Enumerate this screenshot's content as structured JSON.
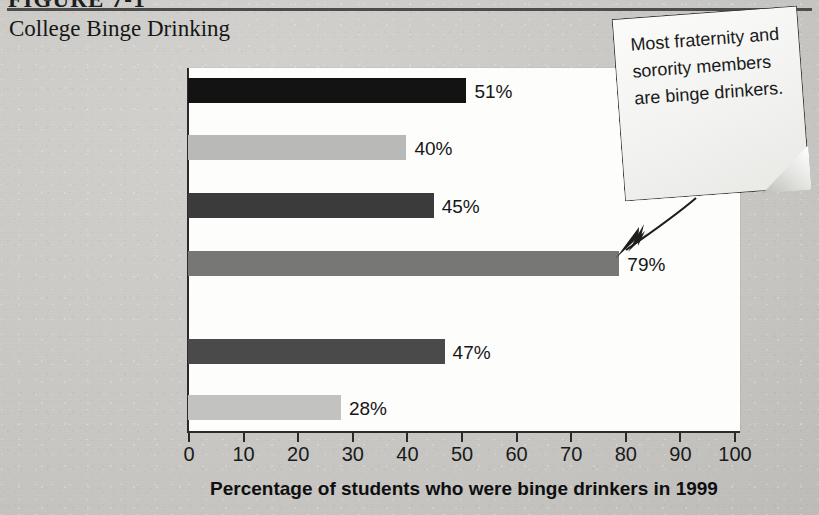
{
  "figure": {
    "number_label": "FIGURE 7-1",
    "title": "College Binge Drinking"
  },
  "callout": {
    "text": "Most fraternity and sorority members are binge drinkers.",
    "arrow_icon": "arrow-down-left-icon"
  },
  "chart_data": {
    "type": "bar",
    "orientation": "horizontal",
    "title": "College Binge Drinking",
    "xlabel": "Percentage of students who were binge drinkers in 1999",
    "ylabel": "",
    "xlim": [
      0,
      100
    ],
    "xticks": [
      0,
      10,
      20,
      30,
      40,
      50,
      60,
      70,
      80,
      90,
      100
    ],
    "grid": false,
    "legend": "none",
    "annotation": "Most fraternity and sorority members are binge drinkers.",
    "annotation_target": "Live in fraternity/sorority",
    "categories": [
      "Men",
      "Women",
      "Live in residence hall",
      "Live in fraternity/sorority",
      "Under 24",
      "24 and over"
    ],
    "category_lines": [
      [
        "Men"
      ],
      [
        "Women"
      ],
      [
        "Live in",
        "residence hall"
      ],
      [
        "Live in",
        "fraternity/sorority"
      ],
      [
        "AGE",
        "Under 24"
      ],
      [
        "24 and over"
      ]
    ],
    "group_header": "AGE",
    "values": [
      51,
      40,
      45,
      79,
      47,
      28
    ],
    "value_labels": [
      "51%",
      "40%",
      "45%",
      "79%",
      "47%",
      "28%"
    ],
    "bar_colors": [
      "#131313",
      "#b9b9b7",
      "#3b3b3b",
      "#777775",
      "#4a4a4a",
      "#c2c2c0"
    ]
  }
}
